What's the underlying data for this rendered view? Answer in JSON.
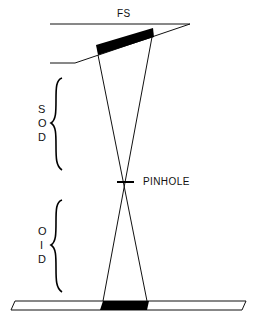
{
  "diagram": {
    "labels": {
      "focal_spot": "FS",
      "pinhole": "PINHOLE",
      "sod": [
        "S",
        "O",
        "D"
      ],
      "oid": [
        "O",
        "I",
        "D"
      ]
    },
    "colors": {
      "line": "#111111",
      "fill": "#000000",
      "background": "#ffffff"
    }
  }
}
